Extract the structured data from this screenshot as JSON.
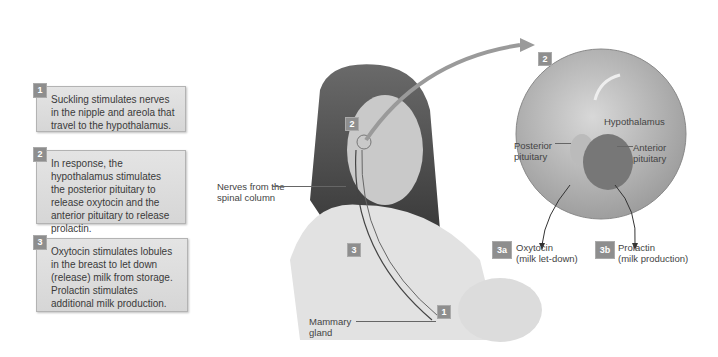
{
  "steps": [
    {
      "number": "1",
      "text": "Suckling stimulates nerves in the nipple and areola that travel to the hypothalamus."
    },
    {
      "number": "2",
      "text": "In response, the hypothalamus stimulates the posterior pituitary to release oxytocin and the anterior pituitary to release prolactin."
    },
    {
      "number": "3",
      "text": "Oxytocin stimulates lobules in the breast to let down (release) milk from storage. Prolactin stimulates additional milk production."
    }
  ],
  "figure_labels": {
    "nerves": "Nerves from the spinal column",
    "mammary": "Mammary gland",
    "hypothalamus": "Hypothalamus",
    "posterior": "Posterior pituitary",
    "anterior": "Anterior pituitary"
  },
  "figure_badges": {
    "head": "2",
    "inset": "2",
    "breast": "1",
    "nerve": "3"
  },
  "outputs": [
    {
      "badge": "3a",
      "hormone": "Oxytocin",
      "effect": "(milk let-down)"
    },
    {
      "badge": "3b",
      "hormone": "Prolactin",
      "effect": "(milk production)"
    }
  ]
}
